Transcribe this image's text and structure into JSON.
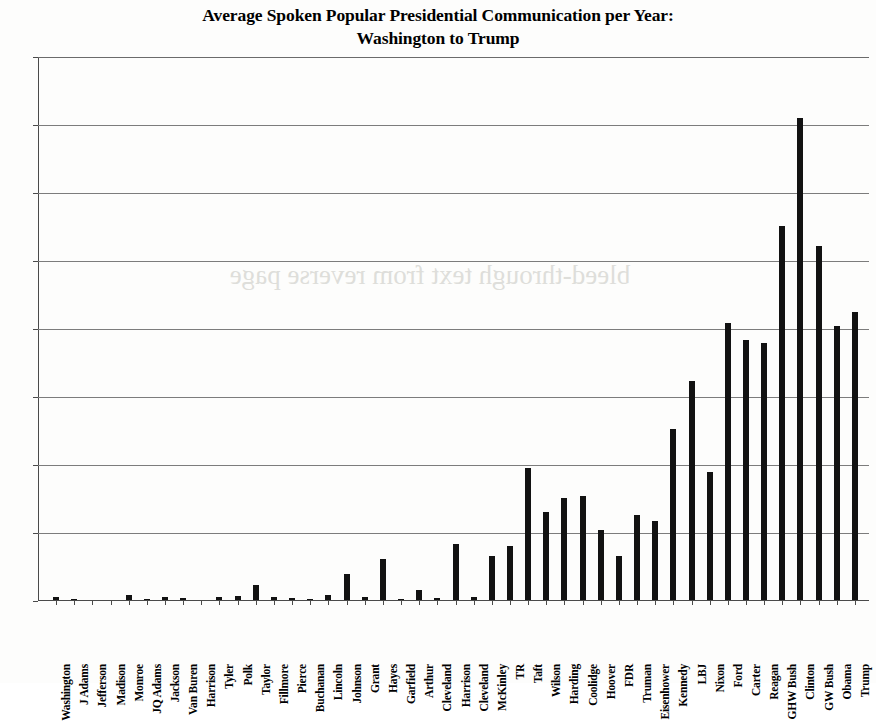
{
  "chart_data": {
    "type": "bar",
    "title": "Average Spoken Popular Presidential Communication per Year: Washington to Trump",
    "title_line1": "Average Spoken Popular Presidential Communication per Year:",
    "title_line2": "Washington to Trump",
    "xlabel": "",
    "ylabel": "",
    "ylim": [
      0,
      800
    ],
    "ytick_labels": [
      "800",
      "700",
      "600",
      "500",
      "400",
      "300",
      "200",
      "100",
      "0"
    ],
    "ytick_values": [
      800,
      700,
      600,
      500,
      400,
      300,
      200,
      100,
      0
    ],
    "grid": true,
    "legend": "none",
    "bar_color": "#121212",
    "categories": [
      "Washington",
      "J Adams",
      "Jefferson",
      "Madison",
      "Monroe",
      "JQ Adams",
      "Jackson",
      "Van Buren",
      "Harrison",
      "Tyler",
      "Polk",
      "Taylor",
      "Fillmore",
      "Pierce",
      "Buchanan",
      "Lincoln",
      "Johnson",
      "Grant",
      "Hayes",
      "Garfield",
      "Arthur",
      "Cleveland",
      "Harrison",
      "Cleveland",
      "McKinley",
      "TR",
      "Taft",
      "Wilson",
      "Harding",
      "Coolidge",
      "Hoover",
      "FDR",
      "Truman",
      "Eisenhower",
      "Kennedy",
      "LBJ",
      "Nixon",
      "Ford",
      "Carter",
      "Reagan",
      "GHW Bush",
      "Clinton",
      "GW Bush",
      "Obama",
      "Trump"
    ],
    "values": [
      5,
      1,
      0,
      0,
      8,
      1,
      5,
      3,
      0,
      4,
      6,
      22,
      4,
      3,
      1,
      8,
      38,
      4,
      60,
      1,
      15,
      3,
      82,
      4,
      65,
      79,
      195,
      130,
      150,
      153,
      103,
      65,
      125,
      116,
      252,
      323,
      188,
      408,
      383,
      378,
      551,
      710,
      521,
      403,
      424
    ]
  },
  "watermark": {
    "bleed_text": "bleed-through text from reverse page"
  }
}
